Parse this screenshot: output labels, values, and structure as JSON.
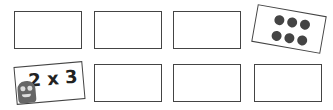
{
  "game": {
    "type": "memory-match",
    "cards": [
      {
        "row": 1,
        "col": 1,
        "state": "face-down",
        "content": ""
      },
      {
        "row": 1,
        "col": 2,
        "state": "face-down",
        "content": ""
      },
      {
        "row": 1,
        "col": 3,
        "state": "face-down",
        "content": ""
      },
      {
        "row": 1,
        "col": 4,
        "state": "face-up",
        "content": "dots",
        "dot_count": 6
      },
      {
        "row": 2,
        "col": 1,
        "state": "face-up",
        "content": "2 x 3",
        "icon": "monster-icon"
      },
      {
        "row": 2,
        "col": 2,
        "state": "face-down",
        "content": ""
      },
      {
        "row": 2,
        "col": 3,
        "state": "face-down",
        "content": ""
      },
      {
        "row": 2,
        "col": 4,
        "state": "face-down",
        "content": ""
      }
    ],
    "colors": {
      "border": "#444444",
      "dot": "#444444",
      "monster": "#666666"
    }
  }
}
